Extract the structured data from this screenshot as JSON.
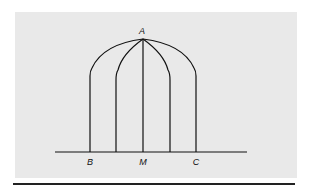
{
  "figure": {
    "labels": {
      "apex": "A",
      "left_base": "B",
      "midpoint": "M",
      "right_base": "C"
    }
  }
}
